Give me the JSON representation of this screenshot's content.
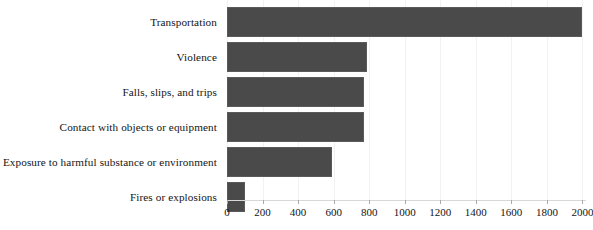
{
  "chart_data": {
    "type": "bar",
    "orientation": "horizontal",
    "title": "",
    "subtitle": "",
    "xlabel": "",
    "ylabel": "",
    "categories": [
      "Transportation",
      "Violence",
      "Falls, slips, and trips",
      "Contact with objects or equipment",
      "Exposure to harmful substance or environment",
      "Fires or explosions"
    ],
    "values": [
      2000,
      790,
      770,
      770,
      590,
      100
    ],
    "series": [
      {
        "name": "Fatal occupational injuries",
        "values": [
          2000,
          790,
          770,
          770,
          590,
          100
        ]
      }
    ],
    "xlim": [
      0,
      2020
    ],
    "xticks": [
      0,
      200,
      400,
      600,
      800,
      1000,
      1200,
      1400,
      1600,
      1800,
      2000
    ],
    "xtick_labels": [
      "0",
      "200",
      "400",
      "600",
      "800",
      "1000",
      "1200",
      "1400",
      "1600",
      "1800",
      "2000"
    ],
    "grid": true,
    "grid_axis": "x",
    "legend": false,
    "legend_position": "none",
    "bar_color": "#4a4a4a",
    "background_color": "#ffffff",
    "annotations": []
  }
}
